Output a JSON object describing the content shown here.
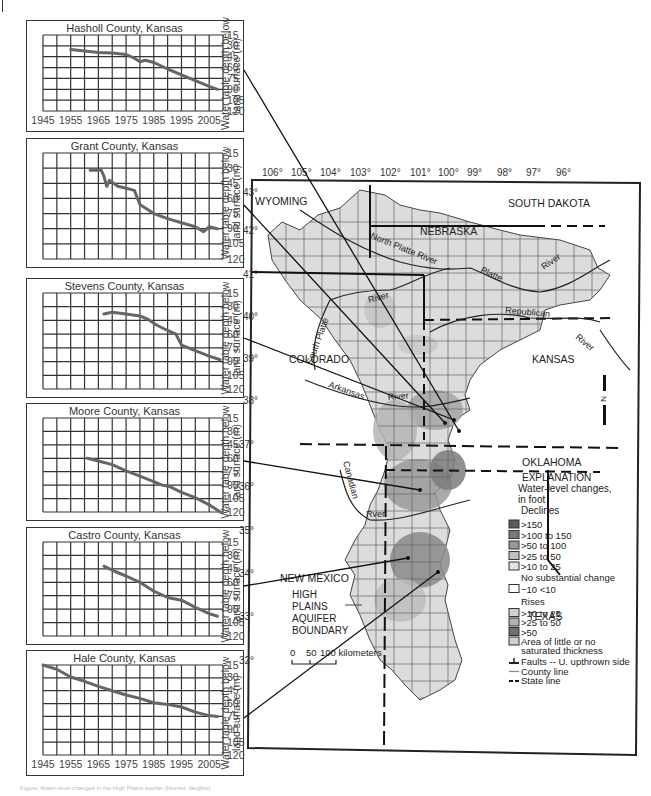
{
  "page": {
    "caption": "Figure: Water-level changes in the High Plains aquifer (blurred, illegible)"
  },
  "chart_data": [
    {
      "type": "line",
      "title": "Hasholl County, Kansas",
      "xlabel": "",
      "ylabel": "Water table depth below land surface (m)",
      "x_ticks": [
        1945,
        1955,
        1965,
        1975,
        1985,
        1995,
        2005
      ],
      "y_ticks": [
        15,
        30,
        45,
        60,
        75,
        90,
        105,
        120
      ],
      "xlim": [
        1945,
        2010
      ],
      "ylim": [
        120,
        10
      ],
      "y_inverted": true,
      "grid": true,
      "x": [
        1955,
        1960,
        1965,
        1970,
        1975,
        1978,
        1980,
        1982,
        1985,
        1990,
        1995,
        2000,
        2005,
        2008
      ],
      "y": [
        35,
        37,
        39,
        40,
        42,
        47,
        52,
        50,
        53,
        62,
        70,
        78,
        86,
        90
      ]
    },
    {
      "type": "line",
      "title": "Grant County, Kansas",
      "xlabel": "",
      "ylabel": "Water table depth below land surface (m)",
      "x_ticks": [],
      "y_ticks": [
        15,
        30,
        45,
        60,
        75,
        90,
        105,
        120
      ],
      "xlim": [
        1945,
        2010
      ],
      "ylim": [
        120,
        10
      ],
      "y_inverted": true,
      "grid": true,
      "x": [
        1962,
        1966,
        1967,
        1968,
        1969,
        1970,
        1972,
        1975,
        1978,
        1980,
        1985,
        1990,
        1995,
        2000,
        2003,
        2005,
        2008
      ],
      "y": [
        32,
        32,
        38,
        48,
        42,
        44,
        48,
        50,
        52,
        66,
        75,
        80,
        84,
        88,
        93,
        88,
        90
      ]
    },
    {
      "type": "line",
      "title": "Stevens County, Kansas",
      "xlabel": "",
      "ylabel": "Water table depth below land surface (m)",
      "x_ticks": [],
      "y_ticks": [
        15,
        30,
        45,
        60,
        75,
        90,
        105,
        120
      ],
      "xlim": [
        1945,
        2010
      ],
      "ylim": [
        120,
        10
      ],
      "y_inverted": true,
      "grid": true,
      "x": [
        1967,
        1970,
        1975,
        1980,
        1983,
        1986,
        1990,
        1993,
        1995,
        2000,
        2005,
        2009
      ],
      "y": [
        38,
        36,
        38,
        40,
        44,
        50,
        56,
        60,
        72,
        78,
        84,
        88
      ]
    },
    {
      "type": "line",
      "title": "Moore County, Kansas",
      "xlabel": "",
      "ylabel": "Water table depth below land surface (m)",
      "x_ticks": [],
      "y_ticks": [
        15,
        30,
        45,
        60,
        75,
        90,
        105,
        120
      ],
      "xlim": [
        1945,
        2010
      ],
      "ylim": [
        120,
        10
      ],
      "y_inverted": true,
      "grid": true,
      "x": [
        1961,
        1965,
        1970,
        1975,
        1980,
        1985,
        1988,
        1991,
        1995,
        2000,
        2005,
        2009
      ],
      "y": [
        60,
        63,
        67,
        74,
        80,
        86,
        90,
        92,
        98,
        104,
        112,
        120
      ]
    },
    {
      "type": "line",
      "title": "Castro County, Kansas",
      "xlabel": "",
      "ylabel": "Water table depth below land surface (m)",
      "x_ticks": [],
      "y_ticks": [
        15,
        30,
        45,
        60,
        75,
        90,
        105,
        120
      ],
      "xlim": [
        1945,
        2010
      ],
      "ylim": [
        120,
        10
      ],
      "y_inverted": true,
      "grid": true,
      "x": [
        1967,
        1971,
        1975,
        1980,
        1985,
        1990,
        1995,
        2000,
        2005,
        2008
      ],
      "y": [
        42,
        48,
        53,
        60,
        70,
        77,
        80,
        88,
        95,
        98
      ]
    },
    {
      "type": "line",
      "title": "Hale County, Kansas",
      "xlabel": "",
      "ylabel": "Water table depth below land surface (m)",
      "x_ticks": [
        1945,
        1955,
        1965,
        1975,
        1985,
        1995,
        2005
      ],
      "y_ticks": [
        15,
        30,
        45,
        60,
        75,
        90,
        105,
        120
      ],
      "xlim": [
        1945,
        2010
      ],
      "ylim": [
        120,
        10
      ],
      "y_inverted": true,
      "grid": true,
      "x": [
        1945,
        1950,
        1955,
        1960,
        1965,
        1970,
        1975,
        1980,
        1985,
        1990,
        1995,
        2000,
        2005,
        2008
      ],
      "y": [
        15,
        20,
        29,
        34,
        40,
        45,
        50,
        54,
        59,
        61,
        64,
        70,
        74,
        75
      ]
    }
  ],
  "map": {
    "longitude_labels": [
      "106°",
      "105°",
      "104°",
      "103°",
      "102°",
      "101°",
      "100°",
      "99°",
      "98°",
      "97°",
      "96°"
    ],
    "latitude_labels": [
      "43°",
      "42°",
      "41°",
      "40°",
      "39°",
      "38°",
      "37°",
      "36°",
      "35°",
      "34°",
      "33°",
      "32°"
    ],
    "states": [
      "WYOMING",
      "SOUTH DAKOTA",
      "NEBRASKA",
      "COLORADO",
      "KANSAS",
      "OKLAHOMA",
      "NEW MEXICO",
      "TEXAS"
    ],
    "rivers": [
      "North Platte River",
      "Platte",
      "River",
      "Republican",
      "River",
      "River",
      "South Platte",
      "Arkansas",
      "River",
      "Canadian",
      "Rver"
    ],
    "boundary_label": [
      "HIGH",
      "PLAINS",
      "AQUIFER",
      "BOUNDARY"
    ],
    "scale_bar": {
      "ticks": [
        "0",
        "50",
        "100 kilometers"
      ]
    },
    "north_arrow": "N",
    "legend": {
      "title": "EXPLANATION",
      "subtitle_1": "Water-level changes,",
      "subtitle_2": "in foot",
      "declines_header": "Declines",
      "declines": [
        {
          "label": ">150",
          "color": "#5a5a5a"
        },
        {
          "label": ">100 to 150",
          "color": "#7a7a7a"
        },
        {
          "label": ">50 to 100",
          "color": "#999999"
        },
        {
          "label": ">25 to 50",
          "color": "#c0c0c0"
        },
        {
          "label": ">10 to 25",
          "color": "#e2e2e2"
        }
      ],
      "no_change_header": "No substantial change",
      "no_change": {
        "label": "−10 <10",
        "color": "#ffffff"
      },
      "rises_header": "Rises",
      "rises": [
        {
          "label": ">10 to 25",
          "color": "#d0d0d0"
        },
        {
          "label": ">25 to 50",
          "color": "#b0b0b0"
        },
        {
          "label": ">50",
          "color": "#6e6e6e"
        }
      ],
      "little_sat": {
        "label_1": "Area of little or no",
        "label_2": "saturated thickness",
        "color": "#cfcfcf"
      },
      "faults": "Faults -- U. upthrown side",
      "county_line": "County line",
      "state_line": "State line"
    }
  }
}
